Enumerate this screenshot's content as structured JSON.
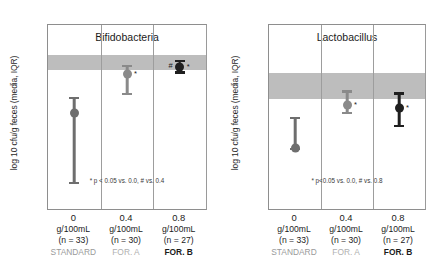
{
  "figure": {
    "panels": [
      {
        "id": "bifidobacteria",
        "title": "Bifidobacteria",
        "ylabel": "log 10 cfu/g feces (media, IQR)",
        "footnote": "* p < 0.05 vs. 0.0, # vs. 0.4",
        "ticks": [
          "2",
          "3",
          "4",
          "5",
          "6",
          "7",
          "8",
          "9",
          "10",
          "11",
          "12"
        ],
        "groups": [
          {
            "dose": "0",
            "unit": "g/100mL",
            "n": "(n = 33)",
            "product": "STANDARD",
            "sig": ""
          },
          {
            "dose": "0.4",
            "unit": "g/100mL",
            "n": "(n = 30)",
            "product": "FOR. A",
            "sig": "*"
          },
          {
            "dose": "0.8",
            "unit": "g/100mL",
            "n": "(n = 27)",
            "product": "FOR. B",
            "sig": "#*"
          }
        ]
      },
      {
        "id": "lactobacillus",
        "title": "Lactobacillus",
        "ylabel": "log 10 cfu/g feces (media, IQR)",
        "footnote": "* p<0.05 vs. 0.0, # vs. 0.8",
        "ticks": [
          "0",
          "1",
          "2",
          "3",
          "4",
          "5",
          "6",
          "7",
          "8",
          "9",
          "10"
        ],
        "groups": [
          {
            "dose": "0",
            "unit": "g/100mL",
            "n": "(n = 33)",
            "product": "STANDARD",
            "sig": ""
          },
          {
            "dose": "0.4",
            "unit": "g/100mL",
            "n": "(n = 30)",
            "product": "FOR. A",
            "sig": "*"
          },
          {
            "dose": "0.8",
            "unit": "g/100mL",
            "n": "(n = 27)",
            "product": "FOR. B",
            "sig": "*"
          }
        ]
      }
    ]
  },
  "chart_data": [
    {
      "type": "scatter",
      "id": "bifidobacteria",
      "title": "Bifidobacteria",
      "xlabel": "",
      "ylabel": "log 10 cfu/g feces (media, IQR)",
      "ylim": [
        2,
        12
      ],
      "yticks": [
        2,
        3,
        4,
        5,
        6,
        7,
        8,
        9,
        10,
        11,
        12
      ],
      "grid": false,
      "legend": "none",
      "categories": [
        "0 g/100mL",
        "0.4 g/100mL",
        "0.8 g/100mL"
      ],
      "category_n": [
        33,
        30,
        27
      ],
      "category_products": [
        "STANDARD",
        "FOR. A",
        "FOR. B"
      ],
      "reference_band": {
        "low": 9.55,
        "high": 10.35,
        "color": "#bdbdbd"
      },
      "series": [
        {
          "name": "median with IQR",
          "medians": [
            7.2,
            9.35,
            9.7
          ],
          "iqr_low": [
            3.35,
            8.2,
            9.35
          ],
          "iqr_high": [
            8.1,
            9.85,
            10.1
          ],
          "marker_colors": [
            "#6e6e6e",
            "#8a8a8a",
            "#1f1f1f"
          ],
          "significance": [
            "",
            "*",
            "#*"
          ]
        }
      ],
      "annotation": "* p < 0.05 vs. 0.0, # vs. 0.4"
    },
    {
      "type": "scatter",
      "id": "lactobacillus",
      "title": "Lactobacillus",
      "xlabel": "",
      "ylabel": "log 10 cfu/g feces (media, IQR)",
      "ylim": [
        0,
        10
      ],
      "yticks": [
        0,
        1,
        2,
        3,
        4,
        5,
        6,
        7,
        8,
        9,
        10
      ],
      "grid": false,
      "legend": "none",
      "categories": [
        "0 g/100mL",
        "0.4 g/100mL",
        "0.8 g/100mL"
      ],
      "category_n": [
        33,
        30,
        27
      ],
      "category_products": [
        "STANDARD",
        "FOR. A",
        "FOR. B"
      ],
      "reference_band": {
        "low": 6.0,
        "high": 7.4,
        "color": "#bdbdbd"
      },
      "series": [
        {
          "name": "median with IQR",
          "medians": [
            3.3,
            5.65,
            5.5
          ],
          "iqr_low": [
            3.2,
            5.15,
            4.45
          ],
          "iqr_high": [
            5.0,
            6.45,
            6.35
          ],
          "marker_colors": [
            "#6e6e6e",
            "#8a8a8a",
            "#1f1f1f"
          ],
          "significance": [
            "",
            "*",
            "*"
          ]
        }
      ],
      "annotation": "* p<0.05 vs. 0.0, # vs. 0.8"
    }
  ]
}
